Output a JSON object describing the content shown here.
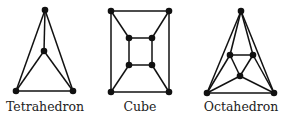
{
  "colors": {
    "stroke": "#111111",
    "node": "#111111",
    "text": "#222222",
    "background": "#ffffff"
  },
  "graphs": [
    {
      "label": "Tetrahedron",
      "label_x": 45,
      "nodes": [
        [
          45,
          10
        ],
        [
          44,
          51
        ],
        [
          16,
          91
        ],
        [
          73,
          91
        ]
      ],
      "edges": [
        [
          0,
          1
        ],
        [
          0,
          2
        ],
        [
          0,
          3
        ],
        [
          1,
          2
        ],
        [
          1,
          3
        ],
        [
          2,
          3
        ]
      ]
    },
    {
      "label": "Cube",
      "label_x": 140,
      "nodes": [
        [
          111,
          11
        ],
        [
          169,
          11
        ],
        [
          169,
          92
        ],
        [
          111,
          92
        ],
        [
          129,
          38
        ],
        [
          152,
          38
        ],
        [
          152,
          65
        ],
        [
          129,
          65
        ]
      ],
      "edges": [
        [
          0,
          1
        ],
        [
          1,
          2
        ],
        [
          2,
          3
        ],
        [
          3,
          0
        ],
        [
          4,
          5
        ],
        [
          5,
          6
        ],
        [
          6,
          7
        ],
        [
          7,
          4
        ],
        [
          0,
          4
        ],
        [
          1,
          5
        ],
        [
          2,
          6
        ],
        [
          3,
          7
        ]
      ]
    },
    {
      "label": "Octahedron",
      "label_x": 241,
      "nodes": [
        [
          241,
          11
        ],
        [
          207,
          93
        ],
        [
          274,
          93
        ],
        [
          230,
          55
        ],
        [
          253,
          55
        ],
        [
          240,
          76
        ]
      ],
      "edges": [
        [
          0,
          1
        ],
        [
          0,
          2
        ],
        [
          1,
          2
        ],
        [
          3,
          4
        ],
        [
          4,
          5
        ],
        [
          5,
          3
        ],
        [
          0,
          3
        ],
        [
          0,
          4
        ],
        [
          1,
          3
        ],
        [
          1,
          5
        ],
        [
          2,
          4
        ],
        [
          2,
          5
        ]
      ]
    }
  ]
}
